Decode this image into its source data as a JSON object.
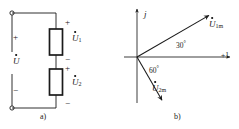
{
  "figure": {
    "panels": [
      {
        "key": "a",
        "caption": "a)",
        "type": "circuit",
        "description": "Series circuit of two elements across a source voltage",
        "source_voltage_label": "U",
        "source_voltage_has_dot": true,
        "elements": [
          {
            "label": "U",
            "subscript": "1",
            "has_dot": true,
            "polarity_top": "+",
            "polarity_bottom": "−"
          },
          {
            "label": "U",
            "subscript": "2",
            "has_dot": true,
            "polarity_top": "+",
            "polarity_bottom": "−"
          }
        ],
        "terminal_polarity_top": "+",
        "terminal_polarity_bottom": "−",
        "terminals": 2
      },
      {
        "key": "b",
        "caption": "b)",
        "type": "phasor",
        "description": "Phasor diagram in the complex plane",
        "axes": {
          "imaginary_label": "j",
          "real_label": "+1"
        },
        "phasors": [
          {
            "label": "U",
            "subscript": "1m",
            "has_dot": true,
            "angle_deg": 30,
            "angle_label": "30",
            "angle_unit": "°",
            "direction": "above real axis"
          },
          {
            "label": "U",
            "subscript": "2m",
            "has_dot": true,
            "angle_deg": -60,
            "angle_label": "60",
            "angle_unit": "°",
            "direction": "below real axis"
          }
        ]
      }
    ]
  },
  "style": {
    "line_color": "#1a1a1a",
    "text_color": "#1a1a1a",
    "background": "#ffffff"
  }
}
